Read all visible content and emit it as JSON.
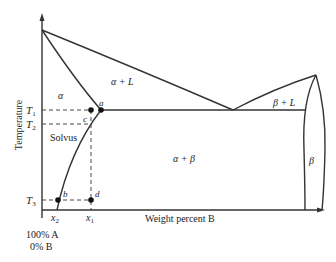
{
  "diagram": {
    "type": "binary eutectic phase diagram",
    "axes": {
      "y_label": "Temperature",
      "x_label": "Weight percent B",
      "origin_label_line1": "100% A",
      "origin_label_line2": "0% B"
    },
    "temperature_ticks": [
      {
        "label": "T",
        "sub": "1"
      },
      {
        "label": "T",
        "sub": "2"
      },
      {
        "label": "T",
        "sub": "3"
      }
    ],
    "composition_ticks": [
      {
        "label": "x",
        "sub": "2"
      },
      {
        "label": "x",
        "sub": "1"
      }
    ],
    "regions": {
      "alpha": "α",
      "alpha_liquid": "α + L",
      "beta_liquid": "β + L",
      "solvus": "Solvus",
      "alpha_beta": "α + β",
      "beta": "β"
    },
    "points": {
      "a": "a",
      "b": "b",
      "c": "c",
      "d": "d"
    }
  }
}
